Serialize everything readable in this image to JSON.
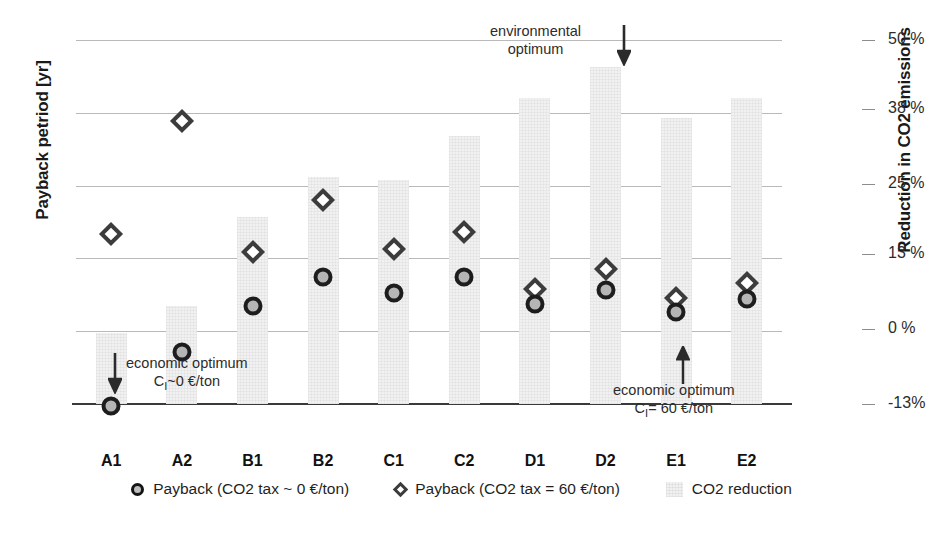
{
  "chart_data": {
    "type": "bar",
    "title": "",
    "categories": [
      "A1",
      "A2",
      "B1",
      "B2",
      "C1",
      "C2",
      "D1",
      "D2",
      "E1",
      "E2"
    ],
    "xlabel": "",
    "ylabel": "Payback petriod [yr]",
    "y2label": "Reduction in CO2 emissions",
    "ylim": [
      0,
      20
    ],
    "yticks": [
      0,
      4,
      8,
      12,
      16,
      20
    ],
    "ytick_labels": [
      "0",
      "4",
      "8",
      "12",
      "16",
      "20"
    ],
    "y2lim": [
      -13,
      50
    ],
    "y2ticks": [
      -13,
      0,
      13,
      25,
      38,
      50
    ],
    "y2tick_labels": [
      "-13%",
      "0 %",
      "13 %",
      "25 %",
      "38 %",
      "50 %"
    ],
    "grid": true,
    "legend_position": "bottom",
    "series": [
      {
        "name": "CO2 reduction",
        "kind": "bar",
        "axis": "right",
        "unit": "%",
        "values": [
          -0.5,
          4.7,
          22.2,
          29.8,
          29.1,
          37.5,
          44.9,
          50.9,
          47.1,
          50.9
        ],
        "values_yr_equivalent": [
          3.9,
          5.4,
          10.3,
          12.5,
          12.3,
          14.7,
          16.8,
          18.5,
          15.7,
          16.8
        ],
        "color": "#f1f1f1"
      },
      {
        "name": "Payback (CO2 tax = 60 €/ton)",
        "kind": "scatter-diamond",
        "axis": "left",
        "unit": "yr",
        "values": [
          9.8,
          16.0,
          8.8,
          11.7,
          9.0,
          9.9,
          6.8,
          7.9,
          6.3,
          7.1
        ],
        "color": "#3c3c3c"
      },
      {
        "name": "Payback (CO2 tax ~ 0 €/ton)",
        "kind": "scatter-circle",
        "axis": "left",
        "unit": "yr",
        "values": [
          0.4,
          3.4,
          5.9,
          7.5,
          6.6,
          7.5,
          6.0,
          6.8,
          5.6,
          6.3
        ],
        "color": "#1d1d1d"
      }
    ],
    "annotations": [
      {
        "id": "environmental-optimum",
        "line1": "environmental",
        "line2": "optimum",
        "target_category": "D2",
        "arrow": "down"
      },
      {
        "id": "economic-optimum-low-tax",
        "line1": "economic optimum",
        "line2": "C",
        "line2_sub": "I",
        "line2_rest": "~0 €/ton",
        "target_category": "A1",
        "arrow": "down"
      },
      {
        "id": "economic-optimum-high-tax",
        "line1": "economic optimum",
        "line2": "C",
        "line2_sub": "I",
        "line2_rest": "= 60 €/ton",
        "target_category": "E1",
        "arrow": "up"
      }
    ]
  },
  "legend": {
    "items": [
      {
        "marker": "circle-marker-icon",
        "label": "Payback (CO2 tax ~ 0 €/ton)"
      },
      {
        "marker": "diamond-marker-icon",
        "label": "Payback (CO2 tax = 60 €/ton)"
      },
      {
        "marker": "bar-swatch-icon",
        "label": "CO2 reduction"
      }
    ]
  },
  "colors": {
    "bar": "#f1f1f1",
    "circle_fill": "#b5b5b5",
    "circle_stroke": "#1d1d1d",
    "diamond_stroke": "#3c3c3c",
    "grid": "#b9b9b9",
    "axis": "#3a3a3a"
  }
}
